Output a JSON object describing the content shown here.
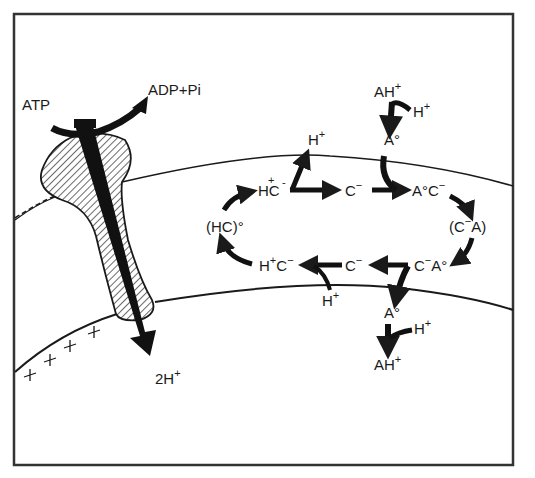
{
  "figure": {
    "colors": {
      "ink": "#1a1a1a",
      "background": "#ffffff",
      "frame": "#333333"
    }
  },
  "pump": {
    "atp_label": "ATP",
    "adp_label": "ADP+Pi",
    "output_label": "2H",
    "output_sup": "+",
    "membrane_charge": "+ + + + +"
  },
  "carrier_cycle": {
    "top_row": {
      "hc_minus": {
        "base": "HC",
        "sup_left": "+",
        "sup_right": "-"
      },
      "c_minus": {
        "base": "C",
        "sup": "−"
      },
      "a0c_minus": {
        "base": "A°C",
        "sup": "−"
      }
    },
    "left_node": {
      "label": "(HC)°"
    },
    "right_node": {
      "label": "(C",
      "sup": "−",
      "tail": "A)"
    },
    "bottom_row": {
      "hplus_c_minus": {
        "h": "H",
        "h_sup": "+",
        "c": "C",
        "c_sup": "−"
      },
      "c_minus": {
        "base": "C",
        "sup": "−"
      },
      "c_minus_a0": {
        "c": "C",
        "c_sup": "−",
        "a": "A°"
      }
    },
    "top_h_release": {
      "base": "H",
      "sup": "+"
    },
    "bottom_h_uptake": {
      "base": "H",
      "sup": "+"
    }
  },
  "acceptor_top": {
    "ah_label": "AH",
    "ah_sup": "+",
    "h_label": "H",
    "h_sup": "+",
    "a0_label": "A°"
  },
  "acceptor_bottom": {
    "a0_label": "A°",
    "h_label": "H",
    "h_sup": "+",
    "ah_label": "AH",
    "ah_sup": "+"
  }
}
